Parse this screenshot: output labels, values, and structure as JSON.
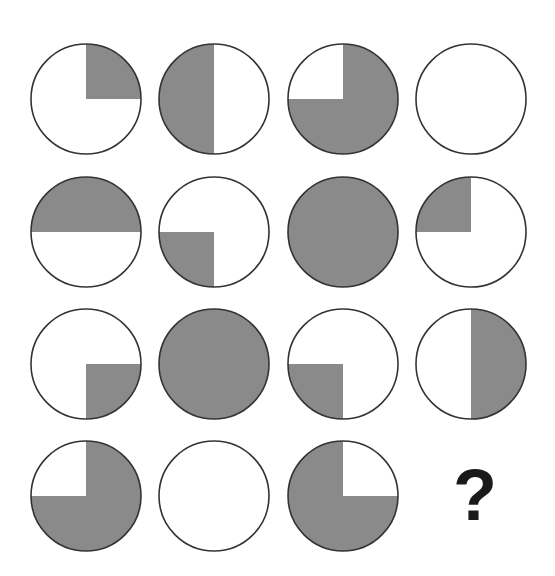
{
  "puzzle": {
    "shade_color": "#8a8a8a",
    "stroke_color": "#333333",
    "question_mark": "?",
    "cells": [
      {
        "row": 1,
        "col": 1,
        "shaded": [
          "TR"
        ]
      },
      {
        "row": 1,
        "col": 2,
        "shaded": [
          "TL",
          "BL"
        ]
      },
      {
        "row": 1,
        "col": 3,
        "shaded": [
          "TR",
          "BL",
          "BR"
        ]
      },
      {
        "row": 1,
        "col": 4,
        "shaded": []
      },
      {
        "row": 2,
        "col": 1,
        "shaded": [
          "TL",
          "TR"
        ]
      },
      {
        "row": 2,
        "col": 2,
        "shaded": [
          "BL"
        ]
      },
      {
        "row": 2,
        "col": 3,
        "shaded": [
          "TL",
          "TR",
          "BL",
          "BR"
        ]
      },
      {
        "row": 2,
        "col": 4,
        "shaded": [
          "TL"
        ]
      },
      {
        "row": 3,
        "col": 1,
        "shaded": [
          "BR"
        ]
      },
      {
        "row": 3,
        "col": 2,
        "shaded": [
          "TL",
          "TR",
          "BL",
          "BR"
        ]
      },
      {
        "row": 3,
        "col": 3,
        "shaded": [
          "BL"
        ]
      },
      {
        "row": 3,
        "col": 4,
        "shaded": [
          "TR",
          "BR"
        ]
      },
      {
        "row": 4,
        "col": 1,
        "shaded": [
          "TR",
          "BL",
          "BR"
        ]
      },
      {
        "row": 4,
        "col": 2,
        "shaded": []
      },
      {
        "row": 4,
        "col": 3,
        "shaded": [
          "TL",
          "BL",
          "BR"
        ]
      }
    ]
  }
}
